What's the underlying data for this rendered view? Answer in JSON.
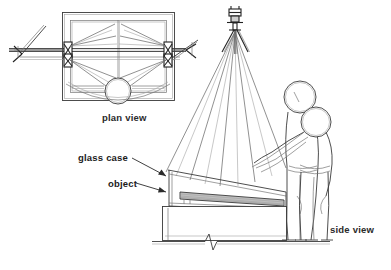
{
  "figure": {
    "background_color": "#ffffff",
    "ink_color": "#3a3a3a",
    "width": 391,
    "height": 270
  },
  "labels": {
    "plan_view": "plan view",
    "side_view": "side view",
    "glass_case": "glass case",
    "object": "object"
  },
  "callouts": [
    {
      "name": "glass-case",
      "text": "glass case",
      "x": 78,
      "y": 160,
      "target_x": 168,
      "target_y": 178
    },
    {
      "name": "object",
      "text": "object",
      "x": 108,
      "y": 186,
      "target_x": 168,
      "target_y": 194
    }
  ],
  "view_labels": [
    {
      "name": "plan-view",
      "text": "plan view",
      "x": 102,
      "y": 121
    },
    {
      "name": "side-view",
      "text": "side view",
      "x": 330,
      "y": 233
    }
  ],
  "scene": {
    "plan_view": {
      "description": "Top-down plan of a rectangular display case with converging sight lines and a circular viewer head at lower edge",
      "case_outer": {
        "x": 62,
        "y": 12,
        "w": 112,
        "h": 88
      },
      "case_inner": {
        "x": 70,
        "y": 20,
        "w": 96,
        "h": 72
      },
      "viewer_head_circle": {
        "cx": 118,
        "cy": 91,
        "r": 13
      },
      "horizontal_rail_y": 50,
      "arm_left_tip_x": 8,
      "arm_right_tip_x": 186,
      "sightline_count": 8
    },
    "side_view": {
      "description": "Elevation showing tripod-mounted instrument projecting sight lines onto a sloped glass vitrine with two figures alongside",
      "instrument": {
        "x": 228,
        "y": 8,
        "label": "tripod-mounted instrument"
      },
      "ray_fan_count": 8,
      "case": {
        "x": 163,
        "y": 168,
        "w": 112,
        "h": 44
      },
      "plinth": {
        "x": 163,
        "y": 206,
        "w": 112,
        "h": 30
      },
      "object_slab": {
        "x": 178,
        "y": 188,
        "w": 96,
        "h": 10
      },
      "floor_y": 241,
      "break_symbol_x": 208,
      "figures": [
        {
          "name": "rear-figure",
          "head_cx": 300,
          "head_cy": 97,
          "head_r": 16
        },
        {
          "name": "front-figure",
          "head_cx": 316,
          "head_cy": 122,
          "head_r": 15
        }
      ]
    }
  }
}
